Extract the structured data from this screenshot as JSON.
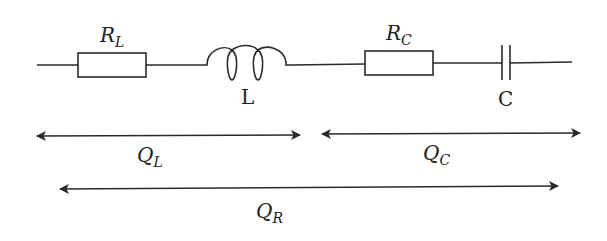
{
  "diagram": {
    "type": "series RLC circuit with quality-factor spans",
    "components": {
      "resistor_L": {
        "symbol": "R",
        "subscript": "L"
      },
      "inductor": {
        "label": "L"
      },
      "resistor_C": {
        "symbol": "R",
        "subscript": "C"
      },
      "capacitor": {
        "label": "C"
      }
    },
    "spans": {
      "QL": {
        "symbol": "Q",
        "subscript": "L"
      },
      "QC": {
        "symbol": "Q",
        "subscript": "C"
      },
      "QR": {
        "symbol": "Q",
        "subscript": "R"
      }
    },
    "colors": {
      "stroke": "#2a2a2a",
      "background": "#ffffff"
    }
  }
}
